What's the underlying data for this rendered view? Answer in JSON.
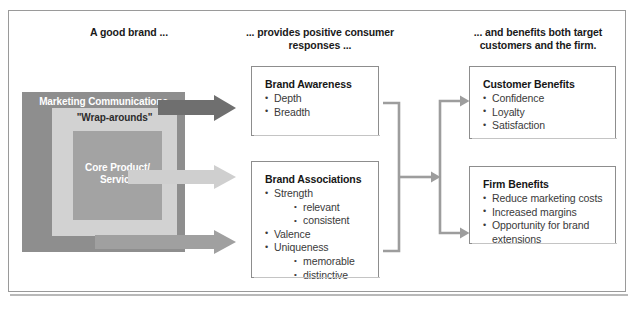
{
  "figure": {
    "headings": {
      "left": "A good brand ...",
      "middle": "... provides positive consumer responses ...",
      "right": "... and benefits both target customers and the firm."
    },
    "brand_layers": {
      "outer_label": "Marketing Communications",
      "middle_label": "\"Wrap-arounds\"",
      "inner_label": "Core Product/ Service"
    },
    "cards": {
      "awareness": {
        "title": "Brand Awareness",
        "items": [
          {
            "text": "Depth",
            "sub": []
          },
          {
            "text": "Breadth",
            "sub": []
          }
        ]
      },
      "associations": {
        "title": "Brand Associations",
        "items": [
          {
            "text": "Strength",
            "sub": [
              "relevant",
              "consistent"
            ]
          },
          {
            "text": "Valence",
            "sub": []
          },
          {
            "text": "Uniqueness",
            "sub": [
              "memorable",
              "distinctive"
            ]
          }
        ]
      },
      "customer": {
        "title": "Customer Benefits",
        "items": [
          {
            "text": "Confidence",
            "sub": []
          },
          {
            "text": "Loyalty",
            "sub": []
          },
          {
            "text": "Satisfaction",
            "sub": []
          }
        ]
      },
      "firm": {
        "title": "Firm Benefits",
        "items": [
          {
            "text": "Reduce marketing costs",
            "sub": []
          },
          {
            "text": "Increased margins",
            "sub": []
          },
          {
            "text": "Opportunity for brand extensions",
            "sub": []
          }
        ]
      }
    },
    "arrows": {
      "to_awareness": "arrow-marketing-communications-to-brand-awareness",
      "to_core": "arrow-core-product-to-brand-associations",
      "to_associations": "arrow-wraparounds-to-brand-associations",
      "merge": "arrow-responses-to-benefits",
      "split_top": "arrow-to-customer-benefits",
      "split_bottom": "arrow-to-firm-benefits"
    },
    "colors": {
      "outer_box": "#8e8e8e",
      "middle_box": "#d2d2d2",
      "inner_box": "#a3a3a3",
      "arrow_dark": "#6f6f6f",
      "arrow_light": "#cfcfcf",
      "arrow_medium": "#a0a0a0",
      "connector": "#9d9d9d",
      "card_border": "#8d8d8d",
      "text": "#1a1a1a"
    }
  }
}
